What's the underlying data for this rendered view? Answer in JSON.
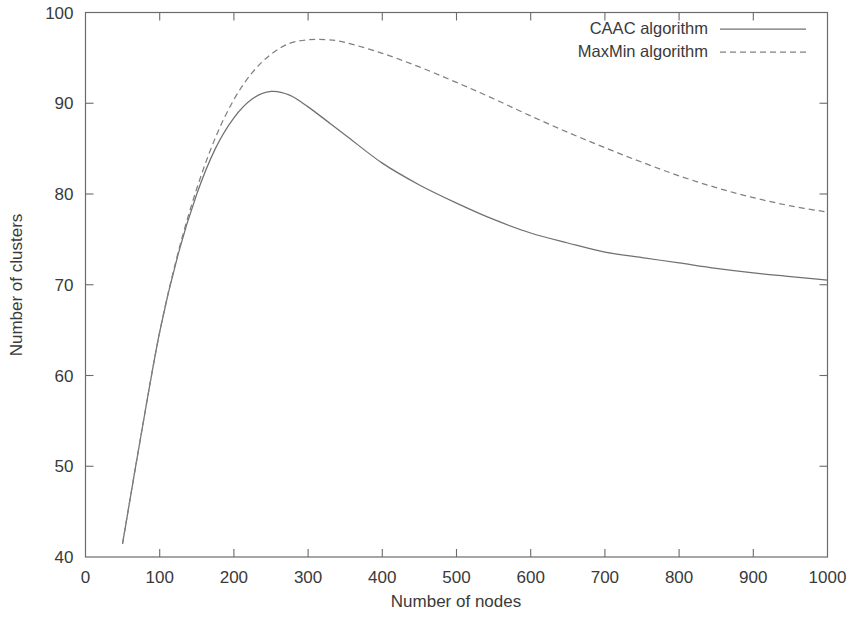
{
  "chart_data": {
    "type": "line",
    "title": "",
    "xlabel": "Number of nodes",
    "ylabel": "Number of clusters",
    "xlim": [
      0,
      1000
    ],
    "ylim": [
      40,
      100
    ],
    "xticks": [
      0,
      100,
      200,
      300,
      400,
      500,
      600,
      700,
      800,
      900,
      1000
    ],
    "yticks": [
      40,
      50,
      60,
      70,
      80,
      90,
      100
    ],
    "xticklabels": [
      "0",
      "100",
      "200",
      "300",
      "400",
      "500",
      "600",
      "700",
      "800",
      "900",
      "1000"
    ],
    "yticklabels": [
      "40",
      "50",
      "60",
      "70",
      "80",
      "90",
      "100"
    ],
    "grid": false,
    "legend_position": "top-right",
    "frame": "box",
    "tick_direction": "in",
    "series": [
      {
        "name": "CAAC algorithm",
        "style": "solid",
        "color": "#707070",
        "x": [
          50,
          75,
          100,
          125,
          150,
          175,
          200,
          225,
          250,
          275,
          300,
          350,
          400,
          450,
          500,
          550,
          600,
          650,
          700,
          750,
          800,
          850,
          900,
          950,
          1000
        ],
        "y": [
          41.5,
          53.5,
          64.8,
          73.4,
          80.0,
          85.0,
          88.4,
          90.5,
          91.3,
          90.9,
          89.6,
          86.5,
          83.4,
          81.0,
          79.0,
          77.2,
          75.7,
          74.6,
          73.6,
          73.0,
          72.4,
          71.8,
          71.3,
          70.9,
          70.5
        ]
      },
      {
        "name": "MaxMin algorithm",
        "style": "dashed",
        "color": "#808080",
        "x": [
          50,
          75,
          100,
          125,
          150,
          175,
          200,
          225,
          250,
          275,
          300,
          325,
          350,
          400,
          450,
          500,
          550,
          600,
          650,
          700,
          750,
          800,
          850,
          900,
          950,
          1000
        ],
        "y": [
          41.5,
          53.5,
          64.8,
          73.6,
          80.6,
          86.2,
          90.4,
          93.4,
          95.4,
          96.6,
          97.0,
          97.0,
          96.7,
          95.5,
          94.0,
          92.3,
          90.5,
          88.6,
          86.8,
          85.1,
          83.5,
          82.0,
          80.7,
          79.6,
          78.7,
          78.0
        ]
      }
    ],
    "legend": [
      {
        "label": "CAAC algorithm",
        "style": "solid"
      },
      {
        "label": "MaxMin algorithm",
        "style": "dashed"
      }
    ]
  }
}
